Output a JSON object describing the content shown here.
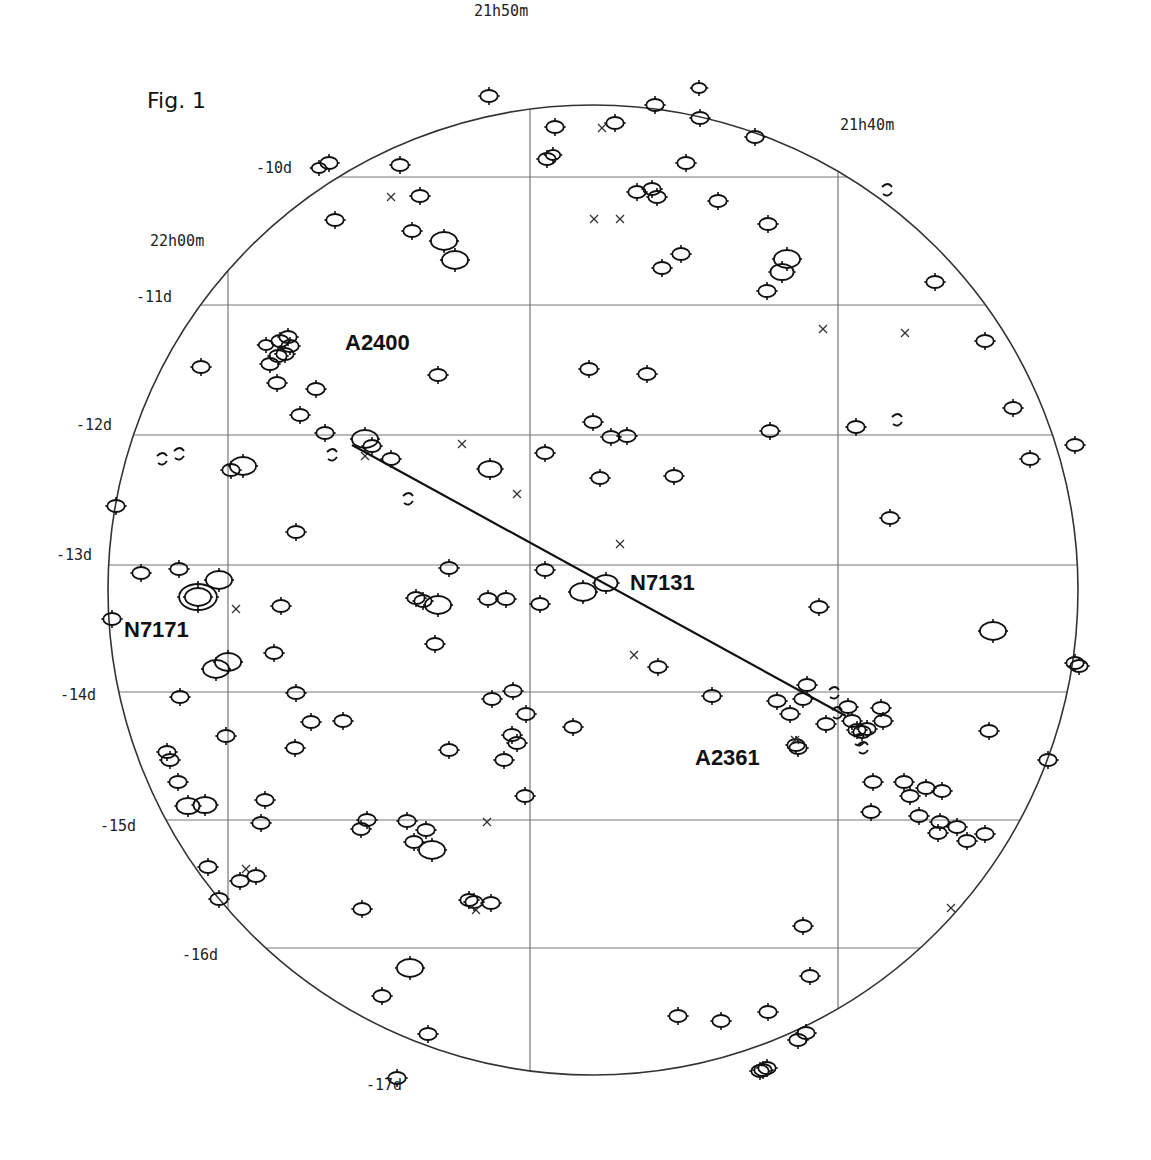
{
  "figure": {
    "title": "Fig. 1",
    "colors": {
      "ink": "#111111",
      "grid": "#777777",
      "background": "#ffffff"
    }
  },
  "grid": {
    "ra_labels": [
      {
        "label": "21h50m",
        "x": 474,
        "y": 16
      },
      {
        "label": "21h40m",
        "x": 840,
        "y": 130
      },
      {
        "label": "22h00m",
        "x": 150,
        "y": 246
      }
    ],
    "dec_labels": [
      {
        "label": "-10d",
        "x": 256,
        "y": 173
      },
      {
        "label": "-11d",
        "x": 136,
        "y": 302
      },
      {
        "label": "-12d",
        "x": 76,
        "y": 430
      },
      {
        "label": "-13d",
        "x": 56,
        "y": 560
      },
      {
        "label": "-14d",
        "x": 60,
        "y": 700
      },
      {
        "label": "-15d",
        "x": 100,
        "y": 831
      },
      {
        "label": "-16d",
        "x": 182,
        "y": 960
      },
      {
        "label": "-17d",
        "x": 366,
        "y": 1090
      }
    ],
    "dec_lines_y": [
      177,
      305,
      435,
      565,
      692,
      820,
      948,
      1077
    ],
    "ra_lines_x": [
      228,
      530,
      838
    ],
    "circle": {
      "cx": 593,
      "cy": 590,
      "r": 485
    }
  },
  "labels": [
    {
      "name": "A2400",
      "x": 345,
      "y": 350
    },
    {
      "name": "N7131",
      "x": 630,
      "y": 590
    },
    {
      "name": "N7171",
      "x": 124,
      "y": 637
    },
    {
      "name": "A2361",
      "x": 695,
      "y": 765
    }
  ],
  "track": {
    "x1": 352,
    "y1": 445,
    "x2": 846,
    "y2": 716
  },
  "galaxies": [
    [
      489,
      96,
      6
    ],
    [
      555,
      127,
      6
    ],
    [
      615,
      123,
      6
    ],
    [
      655,
      105,
      6
    ],
    [
      699,
      88,
      5
    ],
    [
      700,
      118,
      6
    ],
    [
      755,
      137,
      6
    ],
    [
      547,
      159,
      6
    ],
    [
      553,
      155,
      5
    ],
    [
      686,
      163,
      6
    ],
    [
      329,
      163,
      6
    ],
    [
      319,
      168,
      5
    ],
    [
      400,
      165,
      6
    ],
    [
      420,
      196,
      6
    ],
    [
      637,
      192,
      6
    ],
    [
      652,
      189,
      6
    ],
    [
      657,
      197,
      6
    ],
    [
      718,
      201,
      6
    ],
    [
      768,
      224,
      6
    ],
    [
      412,
      231,
      6
    ],
    [
      444,
      241,
      9
    ],
    [
      455,
      260,
      9
    ],
    [
      335,
      220,
      6
    ],
    [
      681,
      254,
      6
    ],
    [
      662,
      268,
      6
    ],
    [
      787,
      259,
      9
    ],
    [
      782,
      272,
      8
    ],
    [
      767,
      291,
      6
    ],
    [
      935,
      282,
      6
    ],
    [
      266,
      345,
      5
    ],
    [
      280,
      341,
      6
    ],
    [
      288,
      337,
      6
    ],
    [
      290,
      346,
      6
    ],
    [
      285,
      354,
      6
    ],
    [
      270,
      364,
      6
    ],
    [
      278,
      356,
      6
    ],
    [
      277,
      383,
      6
    ],
    [
      316,
      389,
      6
    ],
    [
      201,
      367,
      6
    ],
    [
      438,
      375,
      6
    ],
    [
      589,
      369,
      6
    ],
    [
      647,
      374,
      6
    ],
    [
      985,
      341,
      6
    ],
    [
      1013,
      408,
      6
    ],
    [
      300,
      415,
      6
    ],
    [
      325,
      433,
      6
    ],
    [
      365,
      439,
      9
    ],
    [
      372,
      446,
      6
    ],
    [
      391,
      459,
      6
    ],
    [
      593,
      422,
      6
    ],
    [
      611,
      437,
      6
    ],
    [
      627,
      436,
      6
    ],
    [
      674,
      476,
      6
    ],
    [
      545,
      453,
      6
    ],
    [
      770,
      431,
      6
    ],
    [
      856,
      427,
      6
    ],
    [
      1030,
      459,
      6
    ],
    [
      1075,
      445,
      6
    ],
    [
      231,
      470,
      6
    ],
    [
      243,
      466,
      9
    ],
    [
      490,
      469,
      8
    ],
    [
      600,
      478,
      6
    ],
    [
      116,
      506,
      6
    ],
    [
      296,
      532,
      6
    ],
    [
      890,
      518,
      6
    ],
    [
      449,
      568,
      6
    ],
    [
      545,
      570,
      6
    ],
    [
      141,
      573,
      6
    ],
    [
      179,
      569,
      6
    ],
    [
      219,
      580,
      9
    ],
    [
      198,
      597,
      9
    ],
    [
      198,
      597,
      13
    ],
    [
      281,
      606,
      6
    ],
    [
      416,
      598,
      6
    ],
    [
      423,
      601,
      6
    ],
    [
      438,
      605,
      9
    ],
    [
      506,
      599,
      6
    ],
    [
      488,
      599,
      6
    ],
    [
      540,
      604,
      6
    ],
    [
      606,
      583,
      8
    ],
    [
      583,
      592,
      9
    ],
    [
      112,
      619,
      6
    ],
    [
      435,
      644,
      6
    ],
    [
      274,
      653,
      6
    ],
    [
      228,
      662,
      9
    ],
    [
      216,
      669,
      9
    ],
    [
      658,
      667,
      6
    ],
    [
      819,
      607,
      6
    ],
    [
      993,
      631,
      9
    ],
    [
      1075,
      663,
      6
    ],
    [
      1079,
      666,
      6
    ],
    [
      180,
      697,
      6
    ],
    [
      296,
      693,
      6
    ],
    [
      513,
      691,
      6
    ],
    [
      492,
      699,
      6
    ],
    [
      712,
      696,
      6
    ],
    [
      777,
      701,
      6
    ],
    [
      803,
      699,
      6
    ],
    [
      790,
      714,
      6
    ],
    [
      807,
      685,
      6
    ],
    [
      848,
      707,
      6
    ],
    [
      852,
      721,
      6
    ],
    [
      857,
      730,
      6
    ],
    [
      862,
      732,
      6
    ],
    [
      867,
      729,
      6
    ],
    [
      881,
      708,
      6
    ],
    [
      883,
      721,
      6
    ],
    [
      826,
      724,
      6
    ],
    [
      798,
      748,
      6
    ],
    [
      796,
      745,
      6
    ],
    [
      526,
      714,
      6
    ],
    [
      311,
      722,
      6
    ],
    [
      226,
      736,
      6
    ],
    [
      573,
      727,
      6
    ],
    [
      989,
      731,
      6
    ],
    [
      343,
      721,
      6
    ],
    [
      295,
      748,
      6
    ],
    [
      167,
      752,
      6
    ],
    [
      170,
      760,
      6
    ],
    [
      178,
      782,
      6
    ],
    [
      265,
      800,
      6
    ],
    [
      188,
      806,
      8
    ],
    [
      205,
      805,
      8
    ],
    [
      449,
      750,
      6
    ],
    [
      504,
      760,
      6
    ],
    [
      512,
      735,
      6
    ],
    [
      517,
      743,
      6
    ],
    [
      525,
      796,
      6
    ],
    [
      873,
      782,
      6
    ],
    [
      904,
      782,
      6
    ],
    [
      910,
      796,
      6
    ],
    [
      926,
      788,
      6
    ],
    [
      942,
      791,
      6
    ],
    [
      919,
      816,
      6
    ],
    [
      940,
      822,
      6
    ],
    [
      938,
      833,
      6
    ],
    [
      957,
      827,
      6
    ],
    [
      967,
      841,
      6
    ],
    [
      985,
      834,
      6
    ],
    [
      1048,
      760,
      6
    ],
    [
      871,
      812,
      6
    ],
    [
      261,
      823,
      6
    ],
    [
      361,
      829,
      6
    ],
    [
      407,
      821,
      6
    ],
    [
      426,
      830,
      6
    ],
    [
      414,
      842,
      6
    ],
    [
      432,
      850,
      9
    ],
    [
      208,
      867,
      6
    ],
    [
      240,
      881,
      6
    ],
    [
      256,
      876,
      6
    ],
    [
      219,
      899,
      6
    ],
    [
      469,
      900,
      6
    ],
    [
      474,
      902,
      6
    ],
    [
      491,
      903,
      6
    ],
    [
      803,
      926,
      6
    ],
    [
      810,
      976,
      6
    ],
    [
      367,
      820,
      6
    ],
    [
      410,
      968,
      9
    ],
    [
      382,
      996,
      6
    ],
    [
      428,
      1034,
      6
    ],
    [
      397,
      1078,
      6
    ],
    [
      678,
      1016,
      6
    ],
    [
      721,
      1021,
      6
    ],
    [
      768,
      1012,
      6
    ],
    [
      806,
      1033,
      6
    ],
    [
      798,
      1040,
      6
    ],
    [
      760,
      1071,
      6
    ],
    [
      763,
      1070,
      6
    ],
    [
      767,
      1068,
      6
    ],
    [
      362,
      909,
      6
    ]
  ],
  "crosses": [
    [
      391,
      197
    ],
    [
      594,
      219
    ],
    [
      620,
      219
    ],
    [
      602,
      128
    ],
    [
      823,
      329
    ],
    [
      905,
      333
    ],
    [
      462,
      444
    ],
    [
      517,
      494
    ],
    [
      620,
      544
    ],
    [
      236,
      609
    ],
    [
      634,
      655
    ],
    [
      487,
      822
    ],
    [
      951,
      908
    ],
    [
      246,
      869
    ],
    [
      476,
      910
    ],
    [
      795,
      740
    ],
    [
      365,
      456
    ]
  ],
  "fragments": [
    [
      888,
      190
    ],
    [
      898,
      420
    ],
    [
      333,
      455
    ],
    [
      163,
      459
    ],
    [
      409,
      499
    ],
    [
      180,
      454
    ],
    [
      838,
      713
    ],
    [
      860,
      740
    ],
    [
      864,
      748
    ],
    [
      835,
      693
    ]
  ]
}
